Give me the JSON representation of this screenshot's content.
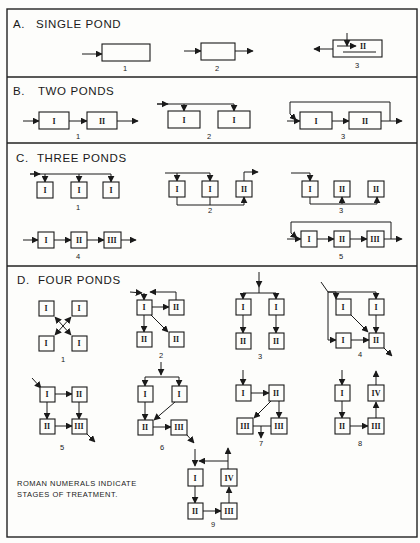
{
  "figure": {
    "sections": [
      {
        "letter": "A.",
        "title": "SINGLE POND",
        "diagrams": [
          {
            "number": "1",
            "ponds": []
          },
          {
            "number": "2",
            "ponds": []
          },
          {
            "number": "3",
            "ponds": [
              "II"
            ]
          }
        ]
      },
      {
        "letter": "B.",
        "title": "TWO PONDS",
        "diagrams": [
          {
            "number": "1",
            "ponds": [
              "I",
              "II"
            ]
          },
          {
            "number": "2",
            "ponds": [
              "I",
              "I"
            ]
          },
          {
            "number": "3",
            "ponds": [
              "I",
              "II"
            ]
          }
        ]
      },
      {
        "letter": "C.",
        "title": "THREE PONDS",
        "diagrams": [
          {
            "number": "1",
            "ponds": [
              "I",
              "I",
              "I"
            ]
          },
          {
            "number": "2",
            "ponds": [
              "I",
              "I",
              "II"
            ]
          },
          {
            "number": "3",
            "ponds": [
              "I",
              "II",
              "II"
            ]
          },
          {
            "number": "4",
            "ponds": [
              "I",
              "II",
              "III"
            ]
          },
          {
            "number": "5",
            "ponds": [
              "I",
              "II",
              "III"
            ]
          }
        ]
      },
      {
        "letter": "D.",
        "title": "FOUR PONDS",
        "diagrams": [
          {
            "number": "1",
            "ponds": [
              "I",
              "I",
              "I",
              "I"
            ]
          },
          {
            "number": "2",
            "ponds": [
              "I",
              "II",
              "II",
              "II"
            ]
          },
          {
            "number": "3",
            "ponds": [
              "I",
              "I",
              "II",
              "II"
            ]
          },
          {
            "number": "4",
            "ponds": [
              "I",
              "I",
              "I",
              "II"
            ]
          },
          {
            "number": "5",
            "ponds": [
              "I",
              "II",
              "II",
              "III"
            ]
          },
          {
            "number": "6",
            "ponds": [
              "I",
              "I",
              "II",
              "III"
            ]
          },
          {
            "number": "7",
            "ponds": [
              "I",
              "II",
              "III",
              "III"
            ]
          },
          {
            "number": "8",
            "ponds": [
              "I",
              "IV",
              "II",
              "III"
            ]
          },
          {
            "number": "9",
            "ponds": [
              "I",
              "IV",
              "II",
              "III"
            ]
          }
        ]
      }
    ],
    "note_line1": "ROMAN NUMERALS INDICATE",
    "note_line2": "STAGES OF TREATMENT."
  }
}
